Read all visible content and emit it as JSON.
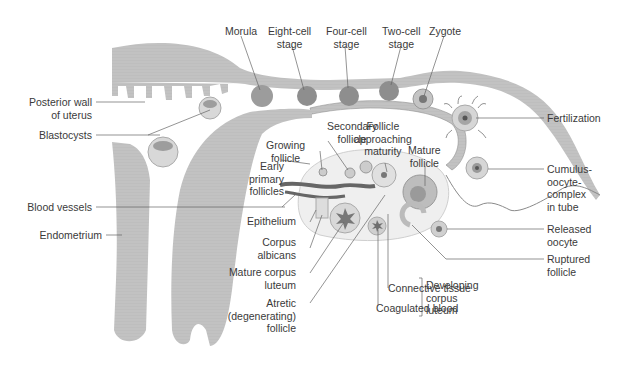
{
  "diagram": {
    "type": "anatomical-illustration",
    "colors": {
      "tissue_gray": "#bdbdbd",
      "tissue_dark": "#8a8a8a",
      "line": "#555555",
      "text": "#3a3a3a",
      "background": "#ffffff"
    },
    "labels": {
      "morula": "Morula",
      "eight_cell": [
        "Eight-cell",
        "stage"
      ],
      "four_cell": [
        "Four-cell",
        "stage"
      ],
      "two_cell": [
        "Two-cell",
        "stage"
      ],
      "zygote": "Zygote",
      "posterior_wall": [
        "Posterior wall",
        "of uterus"
      ],
      "blastocysts": "Blastocysts",
      "fertilization": "Fertilization",
      "secondary_follicle": [
        "Secondary",
        "follicle"
      ],
      "follicle_approaching": [
        "Follicle",
        "approaching",
        "maturity"
      ],
      "growing_follicle": [
        "Growing",
        "follicle"
      ],
      "mature_follicle": [
        "Mature",
        "follicle"
      ],
      "early_primary": [
        "Early",
        "primary",
        "follicles"
      ],
      "cumulus": [
        "Cumulus-",
        "oocyte-",
        "complex",
        "in tube"
      ],
      "blood_vessels": "Blood vessels",
      "epithelium": "Epithelium",
      "endometrium": "Endometrium",
      "corpus_albicans": [
        "Corpus",
        "albicans"
      ],
      "released_oocyte": [
        "Released",
        "oocyte"
      ],
      "mature_corpus_luteum": [
        "Mature corpus",
        "luteum"
      ],
      "ruptured_follicle": [
        "Ruptured",
        "follicle"
      ],
      "atretic": [
        "Atretic",
        "(degenerating)",
        "follicle"
      ],
      "connective_tissue": "Connective tissue",
      "coagulated_blood": "Coagulated blood",
      "developing_corpus_luteum": [
        "Developing",
        "corpus",
        "luteum"
      ]
    }
  }
}
